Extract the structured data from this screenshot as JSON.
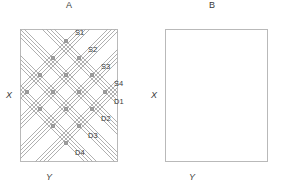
{
  "figure": {
    "width": 281,
    "height": 190,
    "background": "#ffffff"
  },
  "style": {
    "line_color": "#b0b0b0",
    "node_color": "#9a9a9a",
    "marker_color": "#a8a8a8",
    "frame_color": "#b9b9b9",
    "text_color": "#3a3a3a"
  },
  "panels": [
    {
      "id": "A",
      "title": "A",
      "x_axis_label": "X",
      "y_axis_label": "Y",
      "frame": {
        "left": 20,
        "top": 29,
        "width": 98,
        "height": 133
      },
      "node_labels": [
        {
          "text": "S1",
          "node_x": 66,
          "node_y": 41,
          "dx": 9,
          "dy": -9
        },
        {
          "text": "S2",
          "node_x": 79,
          "node_y": 58,
          "dx": 9,
          "dy": -9
        },
        {
          "text": "S3",
          "node_x": 92,
          "node_y": 75,
          "dx": 9,
          "dy": -9
        },
        {
          "text": "S4",
          "node_x": 105,
          "node_y": 92,
          "dx": 9,
          "dy": -9
        },
        {
          "text": "D1",
          "node_x": 105,
          "node_y": 92,
          "dx": 9,
          "dy": 9
        },
        {
          "text": "D2",
          "node_x": 92,
          "node_y": 109,
          "dx": 9,
          "dy": 9
        },
        {
          "text": "D3",
          "node_x": 79,
          "node_y": 126,
          "dx": 9,
          "dy": 9
        },
        {
          "text": "D4",
          "node_x": 66,
          "node_y": 143,
          "dx": 9,
          "dy": 9
        }
      ]
    },
    {
      "id": "B",
      "title": "B",
      "x_axis_label": "X",
      "y_axis_label": "Y",
      "frame": {
        "left": 165,
        "top": 29,
        "width": 103,
        "height": 133
      },
      "node_labels": []
    }
  ],
  "chart_data": {
    "type": "scatter",
    "title": "",
    "xlabel": "Y",
    "ylabel": "X",
    "grid": false,
    "legend": "none",
    "lattice": {
      "origin_x": 66,
      "origin_y": 92,
      "step": 13,
      "rows": 9,
      "diamond_radius": 4
    },
    "panel_a_nodes": [
      [
        66,
        41
      ],
      [
        53,
        58
      ],
      [
        79,
        58
      ],
      [
        40,
        75
      ],
      [
        66,
        75
      ],
      [
        92,
        75
      ],
      [
        27,
        92
      ],
      [
        53,
        92
      ],
      [
        79,
        92
      ],
      [
        105,
        92
      ],
      [
        40,
        109
      ],
      [
        66,
        109
      ],
      [
        92,
        109
      ],
      [
        53,
        126
      ],
      [
        79,
        126
      ],
      [
        66,
        143
      ]
    ],
    "panel_b_markers": [
      [
        216,
        41
      ],
      [
        203,
        58
      ],
      [
        229,
        58
      ],
      [
        190,
        75
      ],
      [
        216,
        75
      ],
      [
        242,
        75
      ],
      [
        177,
        92
      ],
      [
        203,
        92
      ],
      [
        229,
        92
      ],
      [
        255,
        92
      ],
      [
        190,
        109
      ],
      [
        216,
        109
      ],
      [
        242,
        109
      ],
      [
        203,
        126
      ],
      [
        229,
        126
      ],
      [
        216,
        143
      ]
    ],
    "labelled_nodes": [
      {
        "label": "S1",
        "x": 66,
        "y": 41
      },
      {
        "label": "S2",
        "x": 79,
        "y": 58
      },
      {
        "label": "S3",
        "x": 92,
        "y": 75
      },
      {
        "label": "S4",
        "x": 105,
        "y": 92
      },
      {
        "label": "D1",
        "x": 105,
        "y": 92
      },
      {
        "label": "D2",
        "x": 92,
        "y": 109
      },
      {
        "label": "D3",
        "x": 79,
        "y": 126
      },
      {
        "label": "D4",
        "x": 66,
        "y": 143
      }
    ]
  }
}
